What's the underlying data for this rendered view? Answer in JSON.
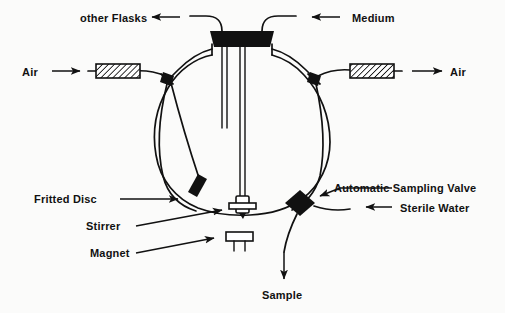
{
  "figure": {
    "background_color": "#fbfbfa",
    "ink_color": "#111111"
  },
  "labels": {
    "other_flasks": "other Flasks",
    "medium": "Medium",
    "air_in": "Air",
    "air_out": "Air",
    "fritted_disc": "Fritted Disc",
    "stirrer": "Stirrer",
    "magnet": "Magnet",
    "automatic_sampling_valve": "Automatic Sampling Valve",
    "sterile_water": "Sterile Water",
    "sample": "Sample"
  },
  "components": [
    {
      "name": "round-bottom-flask",
      "type": "vessel"
    },
    {
      "name": "rubber-stopper",
      "type": "closure"
    },
    {
      "name": "air-inlet-filter",
      "type": "hatched-filter"
    },
    {
      "name": "air-outlet-filter",
      "type": "hatched-filter"
    },
    {
      "name": "left-tube-clamp",
      "type": "clamp"
    },
    {
      "name": "right-tube-clamp",
      "type": "clamp"
    },
    {
      "name": "fritted-disc",
      "type": "sparger"
    },
    {
      "name": "magnetic-stirrer-bar",
      "type": "stirrer"
    },
    {
      "name": "stirrer-magnet",
      "type": "magnet"
    },
    {
      "name": "automatic-sampling-valve",
      "type": "valve"
    }
  ],
  "flows": [
    {
      "name": "air-in-flow",
      "label": "Air",
      "direction": "right"
    },
    {
      "name": "air-out-flow",
      "label": "Air",
      "direction": "right"
    },
    {
      "name": "other-flasks-flow",
      "label": "other Flasks",
      "direction": "left"
    },
    {
      "name": "medium-flow",
      "label": "Medium",
      "direction": "left"
    },
    {
      "name": "sterile-water-flow",
      "label": "Sterile Water",
      "direction": "left"
    },
    {
      "name": "sample-flow",
      "label": "Sample",
      "direction": "down"
    }
  ]
}
